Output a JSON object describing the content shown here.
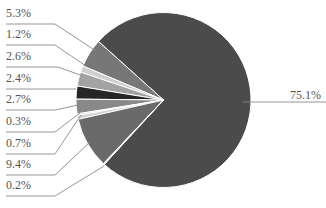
{
  "chart_data": {
    "type": "pie",
    "title": "",
    "center": [
      163.5,
      100
    ],
    "radius": 87.5,
    "start_angle_deg": 312,
    "direction": "counterclockwise-from-top-left",
    "slices": [
      {
        "label": "75.1%",
        "value": 75.1,
        "color": "#4b4b4b",
        "label_side": "right",
        "label_pos": [
          290,
          99
        ],
        "leader": [
          [
            243,
            102
          ],
          [
            326,
            102
          ]
        ]
      },
      {
        "label": "5.3%",
        "value": 5.3,
        "color": "#777777",
        "label_side": "left",
        "label_pos": [
          6,
          17
        ],
        "leader": [
          [
            6,
            24
          ],
          [
            55,
            24
          ],
          [
            96,
            51
          ]
        ]
      },
      {
        "label": "1.2%",
        "value": 1.2,
        "color": "#cfcfcf",
        "label_side": "left",
        "label_pos": [
          6,
          38
        ],
        "leader": [
          [
            6,
            45
          ],
          [
            55,
            45
          ],
          [
            86,
            66
          ]
        ]
      },
      {
        "label": "2.6%",
        "value": 2.6,
        "color": "#a3a3a3",
        "label_side": "left",
        "label_pos": [
          6,
          60
        ],
        "leader": [
          [
            6,
            67
          ],
          [
            58,
            67
          ],
          [
            83,
            76
          ]
        ]
      },
      {
        "label": "2.4%",
        "value": 2.4,
        "color": "#262626",
        "label_side": "left",
        "label_pos": [
          6,
          82
        ],
        "leader": [
          [
            6,
            89
          ],
          [
            76,
            89
          ]
        ]
      },
      {
        "label": "2.7%",
        "value": 2.7,
        "color": "#898989",
        "label_side": "left",
        "label_pos": [
          6,
          103
        ],
        "leader": [
          [
            6,
            110
          ],
          [
            55,
            110
          ],
          [
            78,
            105
          ]
        ]
      },
      {
        "label": "0.3%",
        "value": 0.3,
        "color": "#d6d6d6",
        "label_side": "left",
        "label_pos": [
          6,
          125
        ],
        "leader": [
          [
            6,
            132
          ],
          [
            55,
            132
          ],
          [
            80,
            113
          ]
        ]
      },
      {
        "label": "0.7%",
        "value": 0.7,
        "color": "#d0d0d0",
        "label_side": "left",
        "label_pos": [
          6,
          147
        ],
        "leader": [
          [
            6,
            154
          ],
          [
            55,
            154
          ],
          [
            81,
            115
          ]
        ]
      },
      {
        "label": "9.4%",
        "value": 9.4,
        "color": "#6a6a6a",
        "label_side": "left",
        "label_pos": [
          6,
          168
        ],
        "leader": [
          [
            6,
            175
          ],
          [
            55,
            175
          ],
          [
            90,
            142
          ]
        ]
      },
      {
        "label": "0.2%",
        "value": 0.2,
        "color": "#d8d8d8",
        "label_side": "left",
        "label_pos": [
          6,
          189
        ],
        "leader": [
          [
            6,
            196
          ],
          [
            55,
            196
          ],
          [
            104,
            166
          ]
        ]
      }
    ],
    "legend": "none",
    "grid": false
  }
}
